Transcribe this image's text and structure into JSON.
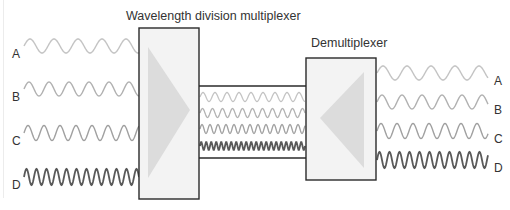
{
  "diagram": {
    "mux_title": "Wavelength division multiplexer",
    "demux_title": "Demultiplexer",
    "inputs": [
      {
        "label": "A",
        "color": "#c4c4c4",
        "period": 24,
        "amp": 7
      },
      {
        "label": "B",
        "color": "#b2b2b2",
        "period": 20,
        "amp": 7
      },
      {
        "label": "C",
        "color": "#a0a0a0",
        "period": 16,
        "amp": 7.5
      },
      {
        "label": "D",
        "color": "#5a5a5a",
        "period": 10,
        "amp": 8
      }
    ],
    "outputs": [
      {
        "label": "A"
      },
      {
        "label": "B"
      },
      {
        "label": "C"
      },
      {
        "label": "D"
      }
    ],
    "colors": {
      "box_fill": "#f3f3f3",
      "box_stroke": "#2a2a2a",
      "prism_fill": "#dcdcdc"
    }
  }
}
